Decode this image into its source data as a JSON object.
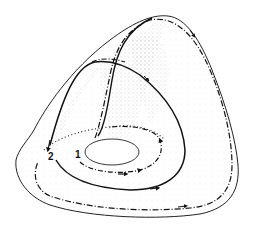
{
  "figure": {
    "labels": [
      {
        "id": "1",
        "text": "1"
      },
      {
        "id": "2",
        "text": "2"
      }
    ],
    "colors": {
      "line": "#111111",
      "outline": "#222222",
      "stipple": "#9a9a9a",
      "background": "#ffffff"
    }
  }
}
